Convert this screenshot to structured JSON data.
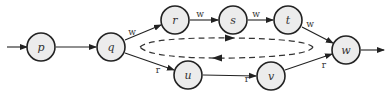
{
  "diagram": {
    "type": "state-transition-graph",
    "nodes": [
      {
        "id": "p",
        "label": "p",
        "x": 41,
        "y": 47
      },
      {
        "id": "q",
        "label": "q",
        "x": 111,
        "y": 47
      },
      {
        "id": "r",
        "label": "r",
        "x": 175,
        "y": 20
      },
      {
        "id": "s",
        "label": "s",
        "x": 233,
        "y": 20
      },
      {
        "id": "t",
        "label": "t",
        "x": 288,
        "y": 20
      },
      {
        "id": "u",
        "label": "u",
        "x": 188,
        "y": 75
      },
      {
        "id": "v",
        "label": "v",
        "x": 271,
        "y": 75
      },
      {
        "id": "w",
        "label": "w",
        "x": 346,
        "y": 50
      }
    ],
    "edges": [
      {
        "from": "start",
        "to": "p",
        "label": ""
      },
      {
        "from": "p",
        "to": "q",
        "label": ""
      },
      {
        "from": "q",
        "to": "r",
        "label": "w"
      },
      {
        "from": "r",
        "to": "s",
        "label": "w"
      },
      {
        "from": "s",
        "to": "t",
        "label": "w"
      },
      {
        "from": "t",
        "to": "w",
        "label": "w"
      },
      {
        "from": "q",
        "to": "u",
        "label": "r"
      },
      {
        "from": "u",
        "to": "v",
        "label": "r"
      },
      {
        "from": "v",
        "to": "w",
        "label": "r"
      },
      {
        "from": "w",
        "to": "end",
        "label": ""
      }
    ],
    "cycle": {
      "style": "dashed",
      "direction": "clockwise-loop",
      "description": "dashed elliptical loop between upper and lower paths"
    }
  }
}
